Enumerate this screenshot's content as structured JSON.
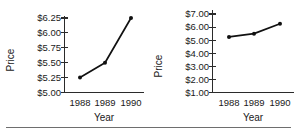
{
  "figure": {
    "bottom_rule": true,
    "line_color": "#111111",
    "axis_color": "#2b2b2b",
    "text_color": "#1a1a1a"
  },
  "chart_data": [
    {
      "id": "left",
      "type": "line",
      "title": "",
      "xlabel": "Year",
      "ylabel": "Price",
      "categories": [
        "1988",
        "1989",
        "1990"
      ],
      "x": [
        1988,
        1989,
        1990
      ],
      "values": [
        5.25,
        5.5,
        6.25
      ],
      "ylim": [
        5.0,
        6.25
      ],
      "yticks": [
        5.0,
        5.25,
        5.5,
        5.75,
        6.0,
        6.25
      ],
      "ytick_labels": [
        "$5.00",
        "$5.25",
        "$5.50",
        "$5.75",
        "$6.00",
        "$6.25"
      ],
      "xtick_labels": [
        "1988",
        "1989",
        "1990"
      ],
      "grid": false,
      "legend": false,
      "markers": true
    },
    {
      "id": "right",
      "type": "line",
      "title": "",
      "xlabel": "Year",
      "ylabel": "Price",
      "categories": [
        "1988",
        "1989",
        "1990"
      ],
      "x": [
        1988,
        1989,
        1990
      ],
      "values": [
        5.25,
        5.5,
        6.25
      ],
      "ylim": [
        1.0,
        7.0
      ],
      "yticks": [
        1.0,
        2.0,
        3.0,
        4.0,
        5.0,
        6.0,
        7.0
      ],
      "ytick_labels": [
        "$1.00",
        "$2.00",
        "$3.00",
        "$4.00",
        "$5.00",
        "$6.00",
        "$7.00"
      ],
      "xtick_labels": [
        "1988",
        "1989",
        "1990"
      ],
      "grid": false,
      "legend": false,
      "markers": true
    }
  ]
}
